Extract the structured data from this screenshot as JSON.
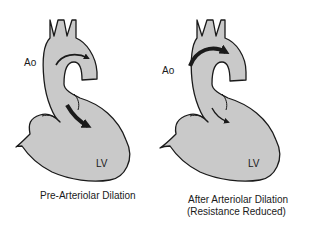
{
  "figure": {
    "colors": {
      "fill": "#c9c9c9",
      "stroke": "#1a1a1a",
      "background": "#ffffff"
    },
    "panels": [
      {
        "id": "pre",
        "ao_label": "Ao",
        "lv_label": "LV",
        "caption_line1": "Pre-Arteriolar Dilation",
        "caption_line2": "",
        "arch_arrow": "thin",
        "ventricle_arrow": "thick"
      },
      {
        "id": "after",
        "ao_label": "Ao",
        "lv_label": "LV",
        "caption_line1": "After Arteriolar Dilation",
        "caption_line2": "(Resistance Reduced)",
        "arch_arrow": "thick",
        "ventricle_arrow": "thin"
      }
    ]
  }
}
